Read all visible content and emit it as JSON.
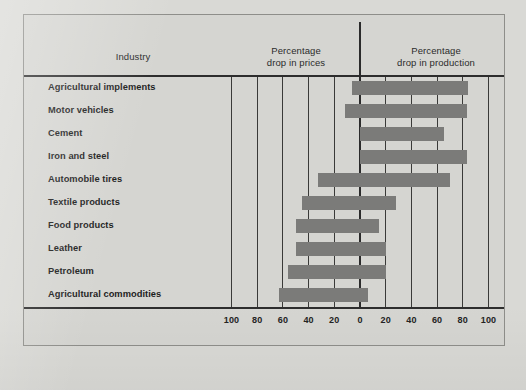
{
  "chart_data": {
    "type": "bar",
    "orientation": "horizontal-diverging",
    "title": "",
    "categories": [
      "Agricultural implements",
      "Motor vehicles",
      "Cement",
      "Iron and steel",
      "Automobile tires",
      "Textile products",
      "Food products",
      "Leather",
      "Petroleum",
      "Agricultural commodities"
    ],
    "series": [
      {
        "name": "Percentage drop in prices",
        "side": "left",
        "values": [
          6,
          12,
          0,
          0,
          33,
          45,
          50,
          50,
          56,
          63
        ]
      },
      {
        "name": "Percentage drop in production",
        "side": "right",
        "values": [
          84,
          83,
          65,
          83,
          70,
          28,
          15,
          20,
          20,
          6
        ]
      }
    ],
    "xlabel": "",
    "ylabel": "Industry",
    "xticks": [
      100,
      80,
      60,
      40,
      20,
      0,
      20,
      40,
      60,
      80,
      100
    ],
    "xlim": [
      -110,
      110
    ],
    "grid": true,
    "legend": "header-columns",
    "bar_color": "#7b7b79"
  },
  "header": {
    "industry": "Industry",
    "prices_line1": "Percentage",
    "prices_line2": "drop in prices",
    "production_line1": "Percentage",
    "production_line2": "drop in production"
  },
  "axis": {
    "ticks": [
      "100",
      "80",
      "60",
      "40",
      "20",
      "0",
      "20",
      "40",
      "60",
      "80",
      "100"
    ]
  }
}
